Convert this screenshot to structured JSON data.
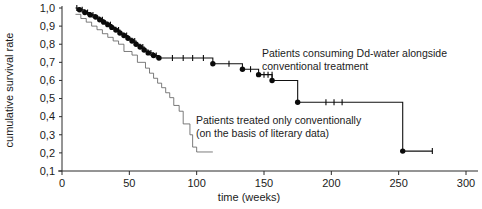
{
  "chart_data": {
    "type": "line",
    "title": "",
    "xlabel": "time (weeks)",
    "ylabel": "cumulative survival rate",
    "xlim": [
      0,
      300
    ],
    "ylim": [
      0.1,
      1.0
    ],
    "grid": false,
    "legend_position": "inline-annotation",
    "xticks": [
      "0",
      "50",
      "100",
      "150",
      "200",
      "250",
      "300"
    ],
    "xtick_values": [
      0,
      50,
      100,
      150,
      200,
      250,
      300
    ],
    "yticks": [
      "0,1",
      "0,2",
      "0,3",
      "0,4",
      "0,5",
      "0,6",
      "0,7",
      "0,8",
      "0,9",
      "1,0"
    ],
    "ytick_values": [
      0.1,
      0.2,
      0.3,
      0.4,
      0.5,
      0.6,
      0.7,
      0.8,
      0.9,
      1.0
    ],
    "decimal_separator": ",",
    "annotations": [
      {
        "id": "annotation-upper-curve",
        "lines": [
          "Patients consuming Dd-water alongside",
          "conventional treatment"
        ],
        "x": 262,
        "y": 57
      },
      {
        "id": "annotation-lower-curve",
        "lines": [
          "Patients treated only conventionally",
          "(on the basis of literary data)"
        ],
        "x": 196,
        "y": 124
      }
    ],
    "series": [
      {
        "name": "Patients consuming Dd-water alongside conventional treatment",
        "style": "thick-step",
        "color": "#111111",
        "marker": "filled-circle",
        "censor_marker": "plus-tick",
        "step": [
          [
            10,
            1.0
          ],
          [
            13,
            1.0
          ],
          [
            13,
            0.99
          ],
          [
            17,
            0.99
          ],
          [
            17,
            0.975
          ],
          [
            21,
            0.975
          ],
          [
            21,
            0.962
          ],
          [
            25,
            0.962
          ],
          [
            25,
            0.95
          ],
          [
            28,
            0.95
          ],
          [
            28,
            0.935
          ],
          [
            31,
            0.935
          ],
          [
            31,
            0.922
          ],
          [
            34,
            0.922
          ],
          [
            34,
            0.908
          ],
          [
            37,
            0.908
          ],
          [
            37,
            0.893
          ],
          [
            40,
            0.893
          ],
          [
            40,
            0.878
          ],
          [
            43,
            0.878
          ],
          [
            43,
            0.862
          ],
          [
            46,
            0.862
          ],
          [
            46,
            0.848
          ],
          [
            49,
            0.848
          ],
          [
            49,
            0.833
          ],
          [
            52,
            0.833
          ],
          [
            52,
            0.818
          ],
          [
            55,
            0.818
          ],
          [
            55,
            0.8
          ],
          [
            58,
            0.8
          ],
          [
            58,
            0.785
          ],
          [
            61,
            0.785
          ],
          [
            61,
            0.768
          ],
          [
            64,
            0.768
          ],
          [
            64,
            0.752
          ],
          [
            68,
            0.752
          ],
          [
            68,
            0.738
          ],
          [
            72,
            0.738
          ],
          [
            72,
            0.724
          ],
          [
            76,
            0.724
          ],
          [
            112,
            0.724
          ],
          [
            112,
            0.692
          ],
          [
            134,
            0.692
          ],
          [
            134,
            0.662
          ],
          [
            146,
            0.662
          ],
          [
            146,
            0.632
          ],
          [
            156,
            0.632
          ],
          [
            156,
            0.6
          ],
          [
            175,
            0.6
          ],
          [
            175,
            0.48
          ],
          [
            253,
            0.48
          ],
          [
            253,
            0.21
          ],
          [
            275,
            0.21
          ]
        ],
        "events": [
          [
            13,
            0.99
          ],
          [
            17,
            0.975
          ],
          [
            21,
            0.962
          ],
          [
            25,
            0.95
          ],
          [
            28,
            0.935
          ],
          [
            31,
            0.922
          ],
          [
            34,
            0.908
          ],
          [
            37,
            0.893
          ],
          [
            40,
            0.878
          ],
          [
            43,
            0.862
          ],
          [
            46,
            0.848
          ],
          [
            49,
            0.833
          ],
          [
            52,
            0.818
          ],
          [
            55,
            0.8
          ],
          [
            58,
            0.785
          ],
          [
            61,
            0.768
          ],
          [
            64,
            0.752
          ],
          [
            68,
            0.738
          ],
          [
            72,
            0.724
          ],
          [
            112,
            0.692
          ],
          [
            134,
            0.662
          ],
          [
            146,
            0.632
          ],
          [
            156,
            0.6
          ],
          [
            175,
            0.48
          ],
          [
            253,
            0.21
          ]
        ],
        "censored": [
          [
            11,
            1.0
          ],
          [
            15,
            0.99
          ],
          [
            19,
            0.975
          ],
          [
            23,
            0.962
          ],
          [
            30,
            0.935
          ],
          [
            36,
            0.908
          ],
          [
            42,
            0.878
          ],
          [
            48,
            0.848
          ],
          [
            54,
            0.818
          ],
          [
            60,
            0.785
          ],
          [
            66,
            0.752
          ],
          [
            70,
            0.738
          ],
          [
            82,
            0.724
          ],
          [
            90,
            0.724
          ],
          [
            97,
            0.724
          ],
          [
            105,
            0.724
          ],
          [
            124,
            0.692
          ],
          [
            140,
            0.662
          ],
          [
            150,
            0.632
          ],
          [
            153,
            0.632
          ],
          [
            156,
            0.632
          ],
          [
            196,
            0.48
          ],
          [
            202,
            0.48
          ],
          [
            208,
            0.48
          ],
          [
            275,
            0.21
          ]
        ]
      },
      {
        "name": "Patients treated only conventionally (on the basis of literary data)",
        "style": "thin-step",
        "color": "#5a5a5a",
        "marker": "none",
        "censor_marker": "none",
        "step": [
          [
            10,
            0.965
          ],
          [
            14,
            0.965
          ],
          [
            14,
            0.942
          ],
          [
            18,
            0.942
          ],
          [
            18,
            0.922
          ],
          [
            22,
            0.922
          ],
          [
            22,
            0.9
          ],
          [
            26,
            0.9
          ],
          [
            26,
            0.88
          ],
          [
            30,
            0.88
          ],
          [
            30,
            0.858
          ],
          [
            34,
            0.858
          ],
          [
            34,
            0.838
          ],
          [
            38,
            0.838
          ],
          [
            38,
            0.818
          ],
          [
            42,
            0.818
          ],
          [
            42,
            0.8
          ],
          [
            46,
            0.8
          ],
          [
            46,
            0.76
          ],
          [
            52,
            0.76
          ],
          [
            52,
            0.74
          ],
          [
            56,
            0.74
          ],
          [
            56,
            0.7
          ],
          [
            62,
            0.7
          ],
          [
            62,
            0.668
          ],
          [
            65,
            0.668
          ],
          [
            65,
            0.64
          ],
          [
            68,
            0.64
          ],
          [
            68,
            0.612
          ],
          [
            71,
            0.612
          ],
          [
            71,
            0.585
          ],
          [
            74,
            0.585
          ],
          [
            74,
            0.56
          ],
          [
            77,
            0.56
          ],
          [
            77,
            0.532
          ],
          [
            80,
            0.532
          ],
          [
            80,
            0.505
          ],
          [
            83,
            0.505
          ],
          [
            83,
            0.462
          ],
          [
            87,
            0.462
          ],
          [
            87,
            0.43
          ],
          [
            90,
            0.43
          ],
          [
            90,
            0.36
          ],
          [
            95,
            0.36
          ],
          [
            95,
            0.3
          ],
          [
            97,
            0.3
          ],
          [
            97,
            0.232
          ],
          [
            100,
            0.232
          ],
          [
            100,
            0.205
          ],
          [
            112,
            0.205
          ]
        ],
        "events": [],
        "censored": []
      }
    ]
  }
}
